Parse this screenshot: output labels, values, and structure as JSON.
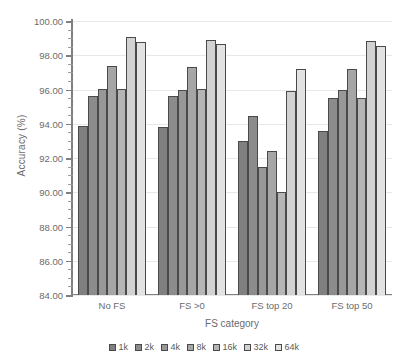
{
  "chart_data": {
    "type": "bar",
    "title": "",
    "xlabel": "FS category",
    "ylabel": "Accuracy (%)",
    "ylim": [
      84.0,
      100.0
    ],
    "ytick_step": 2.0,
    "yminor_step": 0.5,
    "ytick_labels": [
      "84.00",
      "86.00",
      "88.00",
      "90.00",
      "92.00",
      "94.00",
      "96.00",
      "98.00",
      "100.00"
    ],
    "grid": "horizontal",
    "legend_position": "bottom-center",
    "categories": [
      "No FS",
      "FS >0",
      "FS top 20",
      "FS top 50"
    ],
    "series": [
      {
        "name": "1k",
        "color": "#808080",
        "values": [
          93.85,
          93.8,
          93.0,
          93.6
        ]
      },
      {
        "name": "2k",
        "color": "#8c8c8c",
        "values": [
          95.6,
          95.6,
          94.45,
          95.5
        ]
      },
      {
        "name": "4k",
        "color": "#989898",
        "values": [
          96.05,
          96.0,
          91.5,
          95.95
        ]
      },
      {
        "name": "8k",
        "color": "#a6a6a6",
        "values": [
          97.4,
          97.3,
          92.4,
          97.2
        ]
      },
      {
        "name": "16k",
        "color": "#b5b5b5",
        "values": [
          96.05,
          96.05,
          90.0,
          95.5
        ]
      },
      {
        "name": "32k",
        "color": "#d2d2d2",
        "values": [
          99.05,
          98.9,
          95.9,
          98.85
        ]
      },
      {
        "name": "64k",
        "color": "#e2e2e2",
        "values": [
          98.75,
          98.65,
          97.2,
          98.55
        ]
      }
    ]
  }
}
